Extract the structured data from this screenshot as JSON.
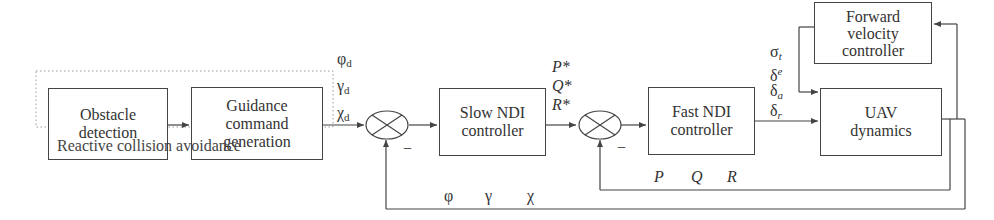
{
  "blocks": {
    "obstacle_detection": "Obstacle\ndetection",
    "guidance": "Guidance\ncommand\ngeneration",
    "slow_ndi": "Slow NDI\ncontroller",
    "fast_ndi": "Fast NDI\ncontroller",
    "uav": "UAV\ndynamics",
    "forward_velocity": "Forward\nvelocity\ncontroller"
  },
  "group_caption": "Reactive collision avoidance",
  "signals": {
    "desired": [
      {
        "sym": "φ",
        "sub": "d"
      },
      {
        "sym": "γ",
        "sub": "d"
      },
      {
        "sym": "χ",
        "sub": "d"
      }
    ],
    "rate_commands": [
      "P*",
      "Q*",
      "R*"
    ],
    "actuators": [
      {
        "sym": "σ",
        "sub": "t"
      },
      {
        "sym": "δ",
        "sub": "e"
      },
      {
        "sym": "δ",
        "sub": "a"
      },
      {
        "sym": "δ",
        "sub": "r"
      }
    ],
    "inner_feedback": [
      "P",
      "Q",
      "R"
    ],
    "outer_feedback": [
      "φ",
      "γ",
      "χ"
    ],
    "minus_sign": "−"
  },
  "colors": {
    "line": "#444444",
    "dotted": "#9a9a9a"
  }
}
